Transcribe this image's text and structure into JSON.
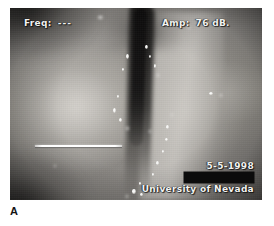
{
  "figure": {
    "panel_label": "A",
    "modality": "videostroboscopy-still",
    "anatomy": "vocal-folds-glottis"
  },
  "overlay": {
    "frequency": {
      "label": "Freq:",
      "value": "---"
    },
    "amplitude": {
      "label": "Amp:",
      "value": "76 dB."
    },
    "date": "5-5-1998",
    "institution": "University of Nevada",
    "redacted_field": "",
    "text_color": "#f2f2f0"
  },
  "annotations": {
    "measurement_line": "horizontal-white-calibration-line"
  },
  "image": {
    "frame_bg": "#3a3a3a",
    "page_bg": "#ffffff"
  },
  "specks": [
    {
      "left": "46.0%",
      "top": "24.0%",
      "w": "3.2px",
      "h": "4.6px",
      "cls": "soft"
    },
    {
      "left": "44.4%",
      "top": "31.5%",
      "w": "2.4px",
      "h": "3.0px",
      "cls": "soft"
    },
    {
      "left": "42.6%",
      "top": "45.5%",
      "w": "2.0px",
      "h": "2.6px",
      "cls": "soft"
    },
    {
      "left": "40.8%",
      "top": "52.0%",
      "w": "3.6px",
      "h": "5.4px",
      "cls": "soft"
    },
    {
      "left": "43.2%",
      "top": "57.5%",
      "w": "3.0px",
      "h": "3.6px",
      "cls": "soft"
    },
    {
      "left": "46.2%",
      "top": "62.0%",
      "w": "2.2px",
      "h": "2.6px",
      "cls": "glow"
    },
    {
      "left": "55.0%",
      "top": "63.5%",
      "w": "2.6px",
      "h": "3.2px",
      "cls": "glow"
    },
    {
      "left": "53.6%",
      "top": "19.5%",
      "w": "2.6px",
      "h": "4.0px",
      "cls": "soft"
    },
    {
      "left": "55.2%",
      "top": "24.5%",
      "w": "2.2px",
      "h": "3.4px",
      "cls": "soft"
    },
    {
      "left": "57.0%",
      "top": "29.0%",
      "w": "2.6px",
      "h": "4.2px",
      "cls": "soft"
    },
    {
      "left": "58.2%",
      "top": "34.5%",
      "w": "2.0px",
      "h": "2.6px",
      "cls": "glow"
    },
    {
      "left": "62.0%",
      "top": "61.0%",
      "w": "3.0px",
      "h": "3.6px",
      "cls": "soft"
    },
    {
      "left": "61.4%",
      "top": "67.5%",
      "w": "2.8px",
      "h": "3.4px",
      "cls": "soft"
    },
    {
      "left": "60.2%",
      "top": "74.0%",
      "w": "2.2px",
      "h": "2.8px",
      "cls": "soft"
    },
    {
      "left": "57.8%",
      "top": "79.5%",
      "w": "3.4px",
      "h": "4.0px",
      "cls": "soft"
    },
    {
      "left": "56.2%",
      "top": "86.0%",
      "w": "2.6px",
      "h": "3.2px",
      "cls": "soft"
    },
    {
      "left": "51.0%",
      "top": "90.5%",
      "w": "2.4px",
      "h": "3.0px",
      "cls": "soft"
    },
    {
      "left": "48.4%",
      "top": "94.5%",
      "w": "3.6px",
      "h": "4.2px",
      "cls": "soft"
    },
    {
      "left": "51.6%",
      "top": "96.5%",
      "w": "2.6px",
      "h": "3.0px",
      "cls": "soft"
    },
    {
      "left": "46.0%",
      "top": "97.5%",
      "w": "2.0px",
      "h": "2.4px",
      "cls": "glow"
    },
    {
      "left": "79.0%",
      "top": "43.5%",
      "w": "3.8px",
      "h": "3.2px",
      "cls": "soft"
    },
    {
      "left": "83.2%",
      "top": "45.0%",
      "w": "2.6px",
      "h": "2.4px",
      "cls": "glow"
    },
    {
      "left": "35.0%",
      "top": "4.0%",
      "w": "5.0px",
      "h": "3.2px",
      "cls": "glow"
    },
    {
      "left": "70.6%",
      "top": "9.5%",
      "w": "2.0px",
      "h": "2.4px",
      "cls": "glow"
    },
    {
      "left": "17.5%",
      "top": "82.0%",
      "w": "1.8px",
      "h": "2.0px",
      "cls": "glow"
    },
    {
      "left": "64.0%",
      "top": "55.0%",
      "w": "1.8px",
      "h": "2.2px",
      "cls": "glow"
    }
  ]
}
